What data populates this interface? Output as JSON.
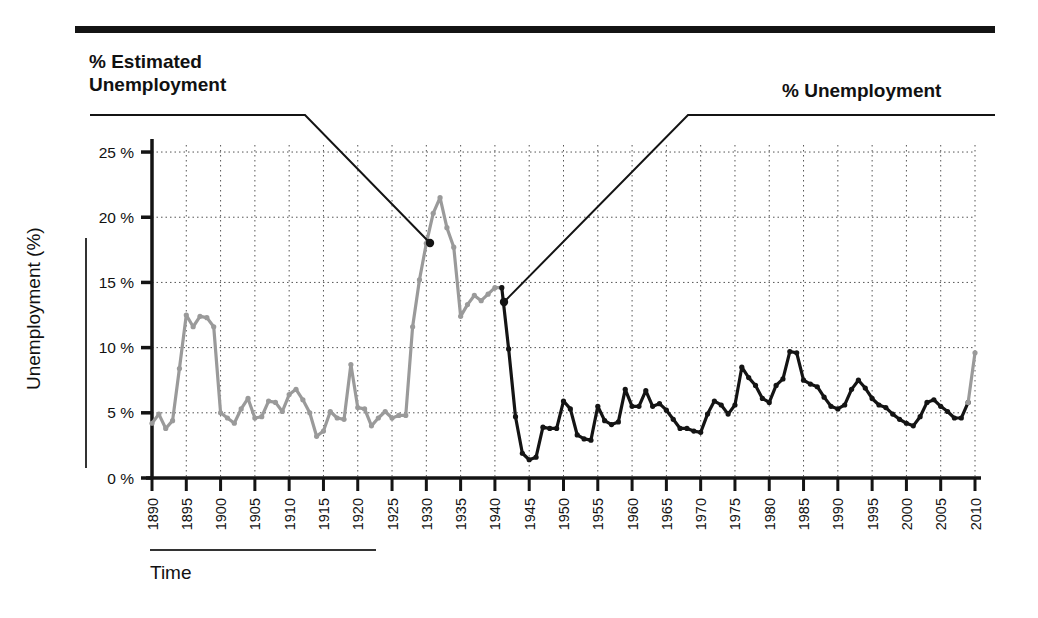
{
  "figure": {
    "top_rule": true,
    "annotations": {
      "left_label": "% Estimated\nUnemployment",
      "right_label": "% Unemployment",
      "left_leader_point_year": 1930,
      "left_leader_point_value": 11.2,
      "right_leader_point_year": 1942,
      "right_leader_point_value": 13.0
    },
    "axes": {
      "x_title": "Time",
      "y_title": "Unemployment (%)"
    }
  },
  "chart_data": {
    "type": "line",
    "title": "",
    "subtitle": "",
    "xlabel": "Time",
    "ylabel": "Unemployment (%)",
    "xlim": [
      1890,
      2010
    ],
    "ylim": [
      0,
      26
    ],
    "grid": true,
    "grid_style": "dotted",
    "legend_position": "callout-labels",
    "y_ticks": [
      0,
      5,
      10,
      15,
      20,
      25
    ],
    "y_tick_labels": [
      "0 %",
      "5 %",
      "10 %",
      "15 %",
      "20 %",
      "25 %"
    ],
    "x_ticks": [
      1890,
      1895,
      1900,
      1905,
      1910,
      1915,
      1920,
      1925,
      1930,
      1935,
      1940,
      1945,
      1950,
      1955,
      1960,
      1965,
      1970,
      1975,
      1980,
      1985,
      1990,
      1995,
      2000,
      2005,
      2010
    ],
    "x_tick_labels": [
      "1890",
      "1895",
      "1900",
      "1905",
      "1910",
      "1915",
      "1920",
      "1925",
      "1930",
      "1935",
      "1940",
      "1945",
      "1950",
      "1955",
      "1960",
      "1965",
      "1970",
      "1975",
      "1980",
      "1985",
      "1990",
      "1995",
      "2000",
      "2005",
      "2010"
    ],
    "series": [
      {
        "name": "% Estimated Unemployment",
        "color": "#9a9a9a",
        "marker": "circle",
        "x": [
          1890,
          1891,
          1892,
          1893,
          1894,
          1895,
          1896,
          1897,
          1898,
          1899,
          1900,
          1901,
          1902,
          1903,
          1904,
          1905,
          1906,
          1907,
          1908,
          1909,
          1910,
          1911,
          1912,
          1913,
          1914,
          1915,
          1916,
          1917,
          1918,
          1919,
          1920,
          1921,
          1922,
          1923,
          1924,
          1925,
          1926,
          1927,
          1928,
          1929,
          1930,
          1931,
          1932,
          1933,
          1934,
          1935,
          1936,
          1937,
          1938,
          1939,
          1940,
          1941
        ],
        "values": [
          4.0,
          5.4,
          3.0,
          11.7,
          18.4,
          13.7,
          14.5,
          14.5,
          12.4,
          6.5,
          5.0,
          4.0,
          3.7,
          3.9,
          5.4,
          4.3,
          1.7,
          2.8,
          8.0,
          5.1,
          5.9,
          6.7,
          4.6,
          4.3,
          7.9,
          8.5,
          5.1,
          4.6,
          1.4,
          1.4,
          5.2,
          11.7,
          6.7,
          2.4,
          5.0,
          3.2,
          1.8,
          3.3,
          4.2,
          3.2,
          8.7,
          15.9,
          23.6,
          24.9,
          21.7,
          20.1,
          16.9,
          14.3,
          19.0,
          17.2,
          14.6,
          9.9
        ],
        "values_rendered": [
          4.2,
          4.9,
          3.8,
          4.4,
          8.4,
          12.5,
          11.6,
          12.4,
          12.3,
          11.6,
          5.0,
          4.6,
          4.2,
          5.3,
          6.1,
          4.6,
          4.7,
          5.9,
          5.8,
          5.1,
          6.4,
          6.8,
          6.0,
          5.0,
          3.2,
          3.6,
          5.1,
          4.6,
          4.5,
          8.7,
          5.4,
          5.3,
          4.0,
          4.6,
          5.1,
          4.6,
          4.8,
          4.8,
          11.6,
          15.2,
          18.0,
          20.3,
          21.5,
          19.2,
          17.7,
          12.4,
          13.3,
          14.0,
          13.6,
          14.1,
          14.6,
          14.6
        ]
      },
      {
        "name": "% Unemployment",
        "color": "#141414",
        "marker": "circle",
        "x": [
          1941,
          1942,
          1943,
          1944,
          1945,
          1946,
          1947,
          1948,
          1949,
          1950,
          1951,
          1952,
          1953,
          1954,
          1955,
          1956,
          1957,
          1958,
          1959,
          1960,
          1961,
          1962,
          1963,
          1964,
          1965,
          1966,
          1967,
          1968,
          1969,
          1970,
          1971,
          1972,
          1973,
          1974,
          1975,
          1976,
          1977,
          1978,
          1979,
          1980,
          1981,
          1982,
          1983,
          1984,
          1985,
          1986,
          1987,
          1988,
          1989,
          1990,
          1991,
          1992,
          1993,
          1994,
          1995,
          1996,
          1997,
          1998,
          1999,
          2000,
          2001,
          2002,
          2003,
          2004,
          2005,
          2006,
          2007,
          2008,
          2009,
          2010
        ],
        "values": [
          14.6,
          9.9,
          4.7,
          1.9,
          1.4,
          1.6,
          3.9,
          3.8,
          3.8,
          5.9,
          5.3,
          3.3,
          3.0,
          2.9,
          5.5,
          4.4,
          4.1,
          4.3,
          6.8,
          5.5,
          5.5,
          6.7,
          5.5,
          5.7,
          5.2,
          4.5,
          3.8,
          3.8,
          3.6,
          3.5,
          4.9,
          5.9,
          5.6,
          4.9,
          5.6,
          8.5,
          7.7,
          7.1,
          6.1,
          5.8,
          7.1,
          7.6,
          9.7,
          9.6,
          7.5,
          7.2,
          7.0,
          6.2,
          5.5,
          5.3,
          5.6,
          6.8,
          7.5,
          6.9,
          6.1,
          5.6,
          5.4,
          4.9,
          4.5,
          4.2,
          4.0,
          4.7,
          5.8,
          6.0,
          5.5,
          5.1,
          4.6,
          4.6,
          5.8,
          9.6
        ],
        "gray_tail": {
          "x": [
            2009,
            2010
          ],
          "values": [
            5.8,
            9.6
          ],
          "color": "#9a9a9a"
        }
      }
    ]
  }
}
